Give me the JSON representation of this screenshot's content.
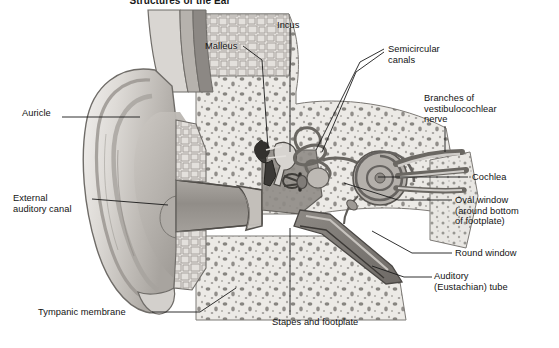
{
  "figure": {
    "title": "Structures of the Ear",
    "figure_number": "",
    "background_color": "#ffffff",
    "text_color": "#131313",
    "leader_color": "#1a1a1a"
  },
  "palette": {
    "skin_light": "#e8e6e3",
    "skin_mid": "#cfccc8",
    "skin_shadow": "#a9a5a1",
    "cartilage": "#dcd9d5",
    "bone_fill": "#eceae6",
    "bone_speckle": "#6e6b67",
    "canal_gray": "#9a9792",
    "ossicle_dark": "#3b3936",
    "membrane": "#b6b2ad",
    "outline": "#55534f"
  },
  "labels": [
    {
      "id": "auricle",
      "text": "Auricle",
      "x": 22,
      "y": 113,
      "align": "left"
    },
    {
      "id": "external-canal",
      "text": "External\nauditory canal",
      "x": 13,
      "y": 193,
      "align": "left"
    },
    {
      "id": "tympanic",
      "text": "Tympanic membrane",
      "x": 38,
      "y": 308,
      "align": "left"
    },
    {
      "id": "malleus",
      "text": "Malleus",
      "x": 205,
      "y": 41,
      "align": "left"
    },
    {
      "id": "incus",
      "text": "Incus",
      "x": 277,
      "y": 20,
      "align": "left"
    },
    {
      "id": "semicircular",
      "text": "Semicircular\ncanals",
      "x": 386,
      "y": 44,
      "align": "left"
    },
    {
      "id": "vcn-nerve",
      "text": "Branches of\nvestibulocochlear\nnerve",
      "x": 424,
      "y": 93,
      "align": "left"
    },
    {
      "id": "cochlea",
      "text": "Cochlea",
      "x": 470,
      "y": 173,
      "align": "left"
    },
    {
      "id": "oval-window",
      "text": "Oval window\n(around bottom\nof footplate)",
      "x": 455,
      "y": 196,
      "align": "left"
    },
    {
      "id": "round-window",
      "text": "Round window",
      "x": 455,
      "y": 249,
      "align": "left"
    },
    {
      "id": "eustachian",
      "text": "Auditory\n(Eustachian) tube",
      "x": 434,
      "y": 272,
      "align": "left"
    },
    {
      "id": "stapes",
      "text": "Stapes and footplate",
      "x": 272,
      "y": 318,
      "align": "left"
    }
  ],
  "leaders": [
    {
      "id": "leader-auricle",
      "points": "62,117 140,117"
    },
    {
      "id": "leader-external-canal",
      "points": "92,199 168,205"
    },
    {
      "id": "leader-tympanic",
      "points": "152,312 200,312 236,288"
    },
    {
      "id": "leader-malleus",
      "points": "243,46 262,60 268,148"
    },
    {
      "id": "leader-incus",
      "points": "290,28 290,152"
    },
    {
      "id": "leader-semicircular-1",
      "points": "384,49 360,62 316,150"
    },
    {
      "id": "leader-semicircular-2",
      "points": "384,52 356,72 322,152"
    },
    {
      "id": "leader-vcn",
      "points": "445,126 445,152"
    },
    {
      "id": "leader-cochlea",
      "points": "468,177 378,177"
    },
    {
      "id": "leader-oval-window",
      "points": "452,200 398,200 344,183"
    },
    {
      "id": "leader-round-window",
      "points": "452,253 412,253 372,231"
    },
    {
      "id": "leader-eustachian",
      "points": "432,277 404,277 372,266"
    },
    {
      "id": "leader-stapes",
      "points": "290,315 290,228"
    }
  ]
}
